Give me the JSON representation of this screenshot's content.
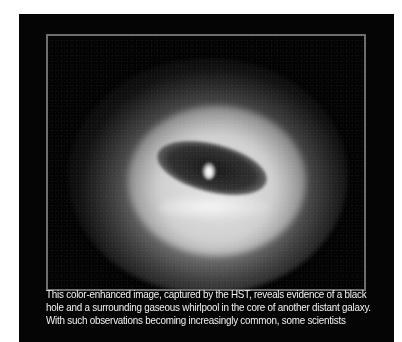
{
  "figure": {
    "image_description": "Color-enhanced HST image of a galaxy core: bright halo surrounding a dark tilted dust disk with a bright central nucleus",
    "colors": {
      "page_background": "#ffffff",
      "panel_background": "#050505",
      "frame_border": "#6e6e6e",
      "caption_text": "#f2f2f2"
    }
  },
  "caption": {
    "lines": [
      "This color-enhanced image, captured by the HST, reveals evidence of a black",
      "hole and a surrounding gaseous whirlpool in the core of another distant galaxy.",
      "With such observations becoming increasingly common, some scientists"
    ]
  }
}
